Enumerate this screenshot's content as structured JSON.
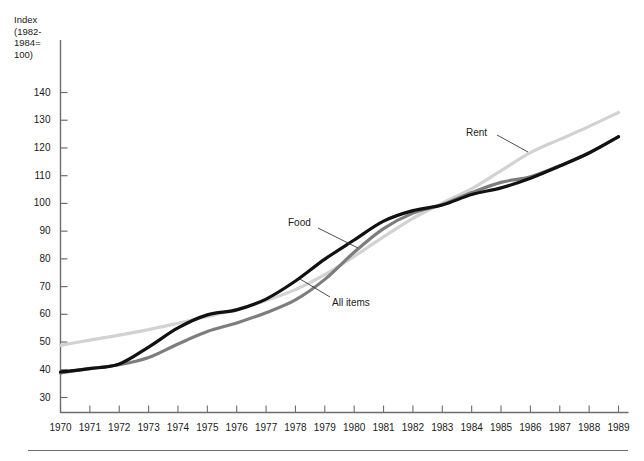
{
  "figure": {
    "axis_caption": "Index\n(1982-\n1984=\n100)",
    "background_color": "#ffffff"
  },
  "chart_data": {
    "type": "line",
    "title": "",
    "xlabel": "",
    "ylabel": "Index (1982-1984=100)",
    "xlim": [
      1970,
      1989
    ],
    "ylim": [
      30,
      145
    ],
    "yticks": [
      30,
      40,
      50,
      60,
      70,
      80,
      90,
      100,
      110,
      120,
      130,
      140
    ],
    "grid": false,
    "legend_position": "inline-annotations",
    "x": [
      1970,
      1971,
      1972,
      1973,
      1974,
      1975,
      1976,
      1977,
      1978,
      1979,
      1980,
      1981,
      1982,
      1983,
      1984,
      1985,
      1986,
      1987,
      1988,
      1989
    ],
    "xtick_labels": [
      "1970",
      "1971",
      "1972",
      "1973",
      "1974",
      "1975",
      "1976",
      "1977",
      "1978",
      "1979",
      "1980",
      "1981",
      "1982",
      "1983",
      "1984",
      "1985",
      "1986",
      "1987",
      "1988",
      "1989"
    ],
    "series": [
      {
        "name": "Food",
        "color": "#111111",
        "values": [
          39.2,
          40.4,
          42.1,
          48.2,
          55.1,
          59.8,
          61.6,
          65.5,
          72.0,
          79.9,
          86.8,
          93.6,
          97.4,
          99.4,
          103.2,
          105.6,
          109.1,
          113.5,
          118.2,
          124.1
        ]
      },
      {
        "name": "All items",
        "color": "#7d7d7d",
        "values": [
          38.8,
          40.5,
          41.8,
          44.4,
          49.3,
          53.8,
          56.9,
          60.6,
          65.2,
          72.6,
          82.4,
          90.9,
          96.5,
          99.6,
          103.9,
          107.6,
          109.6,
          113.6,
          118.3,
          124.0
        ]
      },
      {
        "name": "Rent",
        "color": "#d2d2d2",
        "values": [
          48.8,
          50.7,
          52.5,
          54.5,
          56.8,
          59.2,
          61.8,
          65.0,
          68.9,
          74.3,
          80.9,
          87.9,
          94.6,
          100.1,
          105.3,
          111.8,
          118.3,
          123.1,
          127.8,
          132.8
        ]
      }
    ],
    "annotations": [
      {
        "text": "Food",
        "series": "Food"
      },
      {
        "text": "All items",
        "series": "All items"
      },
      {
        "text": "Rent",
        "series": "Rent"
      }
    ]
  }
}
